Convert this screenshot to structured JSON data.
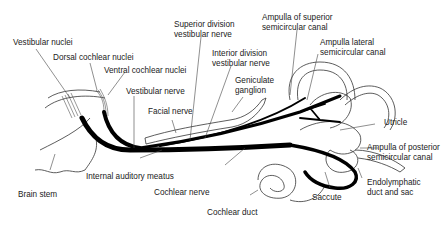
{
  "diagram": {
    "labels": {
      "vestibular_nuclei": "Vestibular nuclei",
      "dorsal_cochlear_nuclei": "Dorsal cochlear nuclei",
      "ventral_cochlear_nuclei": "Ventral cochlear nuclei",
      "vestibular_nerve": "Vestibular nerve",
      "facial_nerve": "Facial nerve",
      "superior_division_1": "Superior division",
      "superior_division_2": "vestibular nerve",
      "inferior_division_1": "Interior division",
      "inferior_division_2": "vestibular nerve",
      "geniculate_1": "Geniculate",
      "geniculate_2": "ganglion",
      "ampulla_superior_1": "Ampulla of superior",
      "ampulla_superior_2": "semicircular canal",
      "ampulla_lateral_1": "Ampulla lateral",
      "ampulla_lateral_2": "semicircular canal",
      "utricle": "Utricle",
      "ampulla_posterior_1": "Ampulla of posterior",
      "ampulla_posterior_2": "semicircular canal",
      "endolymphatic_1": "Endolymphatic",
      "endolymphatic_2": "duct and sac",
      "saccule": "Saccute",
      "cochlear_duct": "Cochlear duct",
      "cochlear_nerve": "Cochlear nerve",
      "internal_auditory_meatus": "Internal auditory meatus",
      "brain_stem": "Brain stem"
    }
  }
}
